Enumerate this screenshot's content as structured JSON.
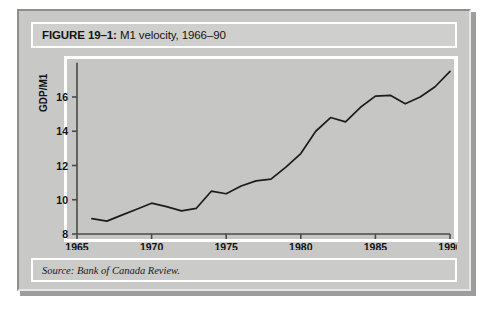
{
  "figure": {
    "label": "FIGURE 19–1:",
    "caption": " M1 velocity, 1966–90",
    "source": "Source: Bank of Canada Review."
  },
  "colors": {
    "page_background": "#ffffff",
    "panel_background": "#c8c8c6",
    "plot_background": "#c6c6c4",
    "plot_border": "#ffffff",
    "line_color": "#1c1c1c",
    "axis_color": "#4a4a4a",
    "text_color": "#141414"
  },
  "chart_data": {
    "type": "line",
    "title": "M1 velocity, 1966–90",
    "xlabel": "",
    "ylabel": "GDP/M1",
    "xlim": [
      1965,
      1990
    ],
    "ylim": [
      8,
      18
    ],
    "grid": false,
    "legend": false,
    "xticks": [
      "1965",
      "1970",
      "1975",
      "1980",
      "1985",
      "1990"
    ],
    "xtick_values": [
      1965,
      1970,
      1975,
      1980,
      1985,
      1990
    ],
    "yticks": [
      "8",
      "10",
      "12",
      "14",
      "16"
    ],
    "ytick_values": [
      8,
      10,
      12,
      14,
      16
    ],
    "series": [
      {
        "name": "M1 velocity (GDP/M1)",
        "x": [
          1966,
          1967,
          1968,
          1969,
          1970,
          1971,
          1972,
          1973,
          1974,
          1975,
          1976,
          1977,
          1978,
          1979,
          1980,
          1981,
          1982,
          1983,
          1984,
          1985,
          1986,
          1987,
          1988,
          1989,
          1990
        ],
        "values": [
          8.9,
          8.75,
          9.1,
          9.45,
          9.8,
          9.6,
          9.35,
          9.5,
          10.5,
          10.35,
          10.8,
          11.1,
          11.2,
          11.9,
          12.7,
          14.0,
          14.8,
          14.55,
          15.4,
          16.05,
          16.1,
          15.6,
          16.0,
          16.6,
          17.5
        ]
      }
    ]
  }
}
